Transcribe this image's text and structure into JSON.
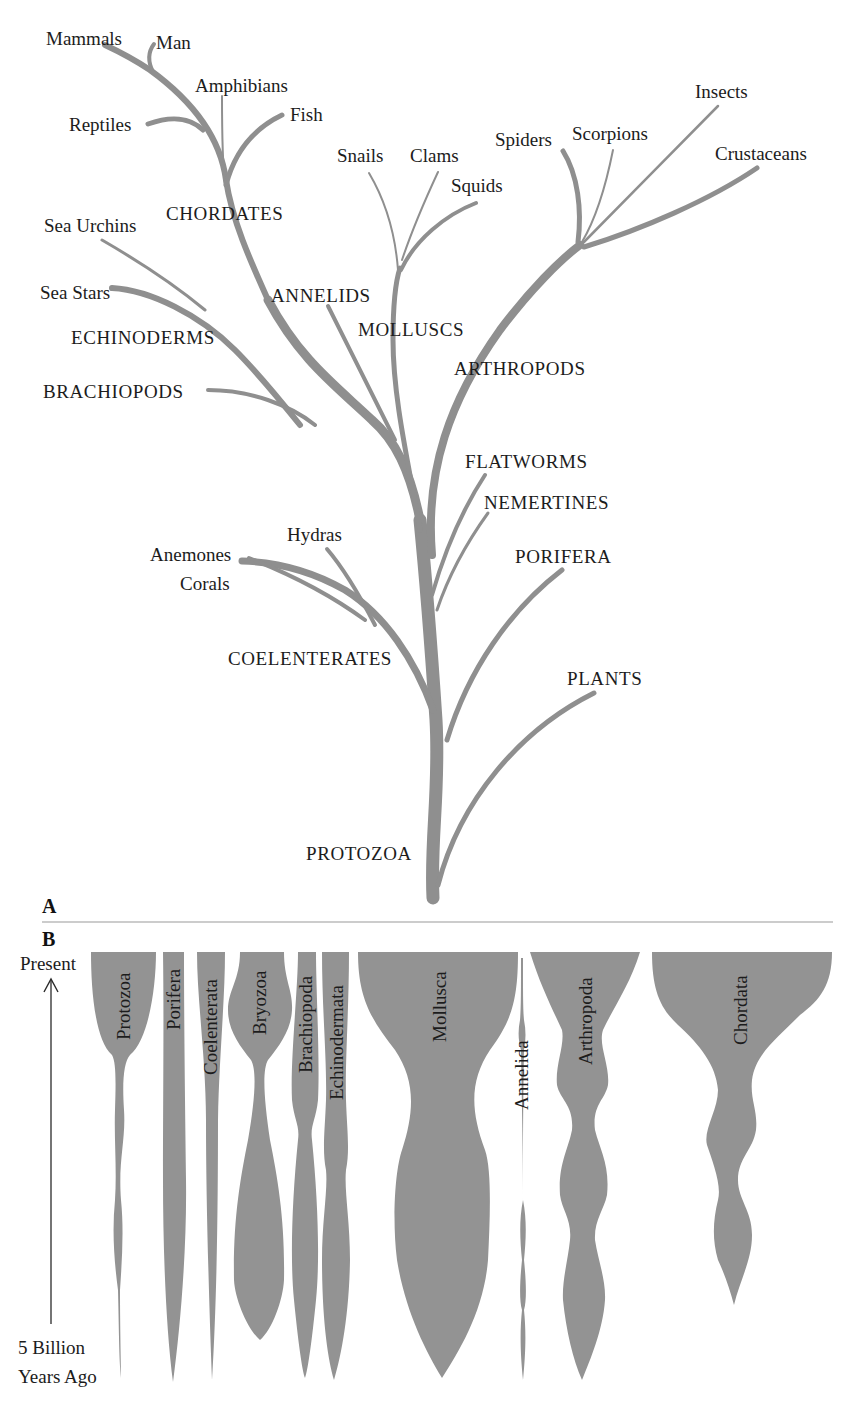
{
  "colors": {
    "branch": "#8f8f8f",
    "spindle": "#939393",
    "text": "#1c1c1c",
    "background": "#ffffff"
  },
  "panel_a": {
    "label": "A",
    "labels": {
      "mammals": "Mammals",
      "man": "Man",
      "amphibians": "Amphibians",
      "fish": "Fish",
      "reptiles": "Reptiles",
      "chordates": "CHORDATES",
      "sea_urchins": "Sea Urchins",
      "sea_stars": "Sea Stars",
      "echinoderms": "ECHINODERMS",
      "brachiopods": "BRACHIOPODS",
      "snails": "Snails",
      "clams": "Clams",
      "squids": "Squids",
      "annelids": "ANNELIDS",
      "molluscs": "MOLLUSCS",
      "spiders": "Spiders",
      "scorpions": "Scorpions",
      "insects": "Insects",
      "crustaceans": "Crustaceans",
      "arthropods": "ARTHROPODS",
      "flatworms": "FLATWORMS",
      "nemertines": "NEMERTINES",
      "porifera": "PORIFERA",
      "hydras": "Hydras",
      "anemones": "Anemones",
      "corals": "Corals",
      "coelenterates": "COELENTERATES",
      "plants": "PLANTS",
      "protozoa": "PROTOZOA"
    }
  },
  "panel_b": {
    "label": "B",
    "axis": {
      "top_label": "Present",
      "bottom_label_line1": "5 Billion",
      "bottom_label_line2": "Years Ago"
    },
    "phyla": [
      {
        "name": "Protozoa"
      },
      {
        "name": "Porifera"
      },
      {
        "name": "Coelenterata"
      },
      {
        "name": "Bryozoa"
      },
      {
        "name": "Brachiopoda"
      },
      {
        "name": "Echinodermata"
      },
      {
        "name": "Mollusca"
      },
      {
        "name": "Annelida"
      },
      {
        "name": "Arthropoda"
      },
      {
        "name": "Chordata"
      }
    ]
  }
}
